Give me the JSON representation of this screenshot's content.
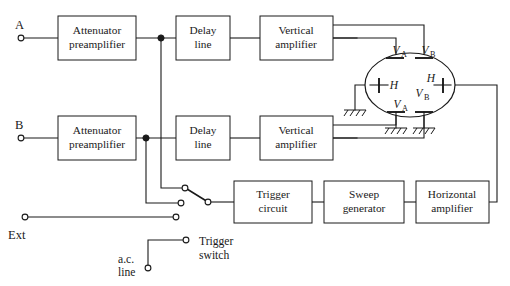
{
  "diagram": {
    "line_color": "#1a1a1a",
    "background": "#ffffff"
  },
  "blocks": [
    {
      "id": "atten_a",
      "line1": "Attenuator",
      "line2": "preamplifier"
    },
    {
      "id": "delay_a",
      "line1": "Delay",
      "line2": "line"
    },
    {
      "id": "vamp_a",
      "line1": "Vertical",
      "line2": "amplifier"
    },
    {
      "id": "atten_b",
      "line1": "Attenuator",
      "line2": "preamplifier"
    },
    {
      "id": "delay_b",
      "line1": "Delay",
      "line2": "line"
    },
    {
      "id": "vamp_b",
      "line1": "Vertical",
      "line2": "amplifier"
    },
    {
      "id": "trigger",
      "line1": "Trigger",
      "line2": "circuit"
    },
    {
      "id": "sweep",
      "line1": "Sweep",
      "line2": "generator"
    },
    {
      "id": "hamp",
      "line1": "Horizontal",
      "line2": "amplifier"
    }
  ],
  "terminals": {
    "input_a": "A",
    "input_b": "B",
    "external": "Ext"
  },
  "annotations": {
    "ac_line_1": "a.c.",
    "ac_line_2": "line",
    "trigger_switch_1": "Trigger",
    "trigger_switch_2": "switch"
  },
  "crt_plates": [
    {
      "id": "plate_top_left",
      "symbol": "V",
      "sub": "A"
    },
    {
      "id": "plate_top_right",
      "symbol": "V",
      "sub": "B"
    },
    {
      "id": "plate_left_h",
      "symbol": "H",
      "sub": ""
    },
    {
      "id": "plate_mid_left_v",
      "symbol": "V",
      "sub": "A"
    },
    {
      "id": "plate_mid_right_v",
      "symbol": "V",
      "sub": "B"
    },
    {
      "id": "plate_right_h",
      "symbol": "H",
      "sub": ""
    }
  ]
}
